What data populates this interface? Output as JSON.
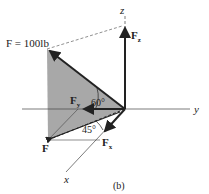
{
  "diagram": {
    "force_label": "F = 100lb",
    "axes": {
      "x": "x",
      "y": "y",
      "z": "z"
    },
    "components": {
      "fz": "F",
      "fz_sub": "z",
      "fy": "F",
      "fy_sub": "y",
      "fx": "F",
      "fx_sub": "x",
      "f": "F"
    },
    "angles": {
      "a60": "60°",
      "a45": "45°"
    },
    "caption": "(b)",
    "colors": {
      "shade": "#a8a8a8",
      "line": "#222222"
    }
  }
}
